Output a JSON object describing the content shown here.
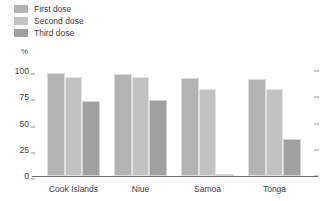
{
  "legend": {
    "items": [
      {
        "label": "First dose",
        "color": "#b3b3b3",
        "icon": "legend-swatch-icon"
      },
      {
        "label": "Second dose",
        "color": "#c2c2c2",
        "icon": "legend-swatch-icon"
      },
      {
        "label": "Third dose",
        "color": "#a0a0a0",
        "icon": "legend-swatch-icon"
      }
    ]
  },
  "axis": {
    "y_unit": "%",
    "y_ticks": [
      "100",
      "75",
      "50",
      "25",
      "0"
    ]
  },
  "chart_data": {
    "type": "bar",
    "title": "",
    "subtitle": "",
    "xlabel": "",
    "ylabel": "%",
    "ylim": [
      0,
      100
    ],
    "yticks": [
      0,
      25,
      50,
      75,
      100
    ],
    "grid": false,
    "legend_position": "top-left",
    "categories": [
      "Cook Islands",
      "Niue",
      "Samoa",
      "Tonga"
    ],
    "series": [
      {
        "name": "First dose",
        "color": "#b3b3b3",
        "values": [
          98,
          97,
          93,
          92
        ]
      },
      {
        "name": "Second dose",
        "color": "#c2c2c2",
        "values": [
          94,
          94,
          83,
          83
        ]
      },
      {
        "name": "Third dose",
        "color": "#a0a0a0",
        "values": [
          71,
          72,
          0.5,
          35
        ]
      }
    ]
  }
}
